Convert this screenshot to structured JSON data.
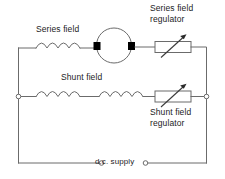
{
  "diagram": {
    "colors": {
      "wire": "#6b6b6b",
      "text": "#1c1c1c",
      "brush": "#000000",
      "background": "#ffffff"
    },
    "labels": {
      "series_field": "Series field",
      "shunt_field": "Shunt field",
      "series_field_regulator_line1": "Series field",
      "series_field_regulator_line2": "regulator",
      "shunt_field_regulator_line1": "Shunt field",
      "shunt_field_regulator_line2": "regulator",
      "dc_supply": "d.c. supply"
    },
    "components": [
      {
        "name": "series-field-coil",
        "type": "inductor",
        "humps": 4
      },
      {
        "name": "motor-armature",
        "type": "circle-with-brushes"
      },
      {
        "name": "series-field-regulator",
        "type": "rheostat"
      },
      {
        "name": "shunt-field-coil-left",
        "type": "inductor",
        "humps": 4
      },
      {
        "name": "shunt-field-coil-right",
        "type": "inductor",
        "humps": 4
      },
      {
        "name": "shunt-field-regulator",
        "type": "rheostat"
      },
      {
        "name": "terminal-left",
        "type": "terminal"
      },
      {
        "name": "terminal-right",
        "type": "terminal"
      },
      {
        "name": "terminal-supply-left",
        "type": "terminal"
      },
      {
        "name": "terminal-supply-right",
        "type": "terminal"
      }
    ]
  }
}
